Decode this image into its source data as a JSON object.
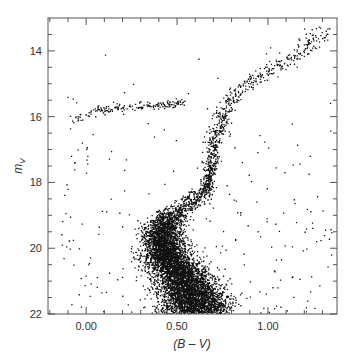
{
  "chart_data": {
    "type": "scatter",
    "title": "",
    "xlabel": "(B – V)",
    "ylabel": "m_V",
    "ylabel_main": "m",
    "ylabel_sub": "V",
    "xlim": [
      -0.21,
      1.38
    ],
    "ylim": [
      22,
      13
    ],
    "y_inverted": true,
    "grid": false,
    "legend": null,
    "x_major_ticks": [
      0.0,
      0.5,
      1.0
    ],
    "x_tick_labels": [
      "0.00",
      "0.50",
      "1.00"
    ],
    "x_minor_step": 0.1,
    "y_major_ticks": [
      14,
      16,
      18,
      20,
      22
    ],
    "y_tick_labels": [
      "14",
      "16",
      "18",
      "20",
      "22"
    ],
    "y_minor_step": 0.5,
    "marker": {
      "shape": "dot",
      "size": 1.3,
      "color": "#111111"
    },
    "series": [
      {
        "name": "main-sequence",
        "description": "dense cloud, color ~0.40 at V=19.5 shifting to ~0.62 at V=22",
        "points_approx": 6000,
        "ridge": [
          [
            0.46,
            19.0
          ],
          [
            0.41,
            19.6
          ],
          [
            0.44,
            20.2
          ],
          [
            0.52,
            20.8
          ],
          [
            0.58,
            21.4
          ],
          [
            0.62,
            22.0
          ]
        ]
      },
      {
        "name": "subgiant-branch",
        "description": "turnoff to base of RGB",
        "points_approx": 400,
        "ridge": [
          [
            0.4,
            19.2
          ],
          [
            0.48,
            18.9
          ],
          [
            0.58,
            18.6
          ],
          [
            0.66,
            18.2
          ]
        ]
      },
      {
        "name": "red-giant-branch",
        "description": "narrow sequence rising to upper right",
        "points_approx": 700,
        "ridge": [
          [
            0.66,
            18.2
          ],
          [
            0.68,
            17.5
          ],
          [
            0.7,
            16.8
          ],
          [
            0.73,
            16.2
          ],
          [
            0.77,
            15.6
          ],
          [
            0.85,
            15.1
          ],
          [
            0.97,
            14.7
          ],
          [
            1.1,
            14.3
          ],
          [
            1.22,
            13.8
          ],
          [
            1.3,
            13.3
          ]
        ]
      },
      {
        "name": "horizontal-branch",
        "description": "from blue tail near (-0.10,16.3) flattening at V~15.65 to ~0.50",
        "points_approx": 180,
        "ridge": [
          [
            -0.12,
            16.4
          ],
          [
            -0.05,
            16.05
          ],
          [
            0.05,
            15.8
          ],
          [
            0.15,
            15.72
          ],
          [
            0.3,
            15.68
          ],
          [
            0.45,
            15.62
          ],
          [
            0.52,
            15.55
          ]
        ]
      },
      {
        "name": "field-stars",
        "description": "sparse scatter across the plot",
        "points_approx": 250
      }
    ]
  }
}
